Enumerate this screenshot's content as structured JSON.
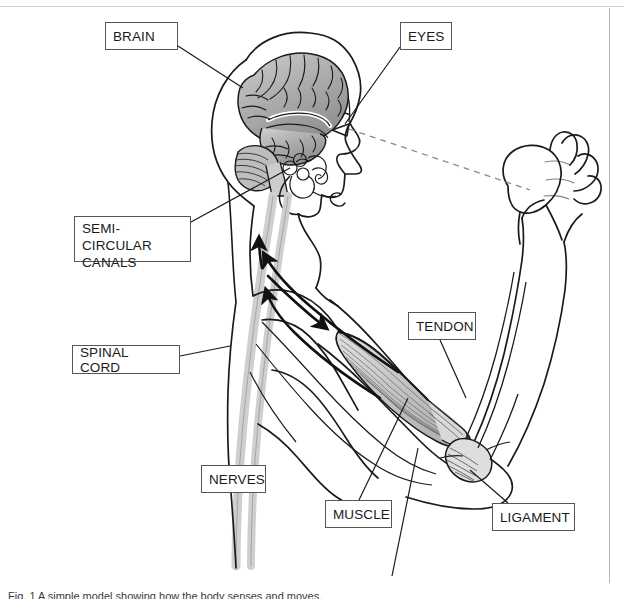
{
  "figure": {
    "background_color": "#ffffff",
    "line_color": "#1a1a1a",
    "brain_fill": "#a8a8a8",
    "nerve_fill": "#d6d6d6",
    "muscle_fill": "#c9c9c9",
    "caption": "Fig. 1  A simple model showing how the body senses and moves."
  },
  "labels": [
    {
      "id": "brain",
      "text": "BRAIN",
      "x": 105,
      "y": 22,
      "w": 73,
      "h": 28,
      "lines": 1
    },
    {
      "id": "eyes",
      "text": "EYES",
      "x": 400,
      "y": 22,
      "w": 52,
      "h": 28,
      "lines": 1
    },
    {
      "id": "semi-circular-canals",
      "text": "SEMI-CIRCULAR\nCANALS",
      "x": 74,
      "y": 216,
      "w": 117,
      "h": 46,
      "lines": 2
    },
    {
      "id": "spinal-cord",
      "text": "SPINAL CORD",
      "x": 72,
      "y": 345,
      "w": 108,
      "h": 29,
      "lines": 1
    },
    {
      "id": "nerves",
      "text": "NERVES",
      "x": 201,
      "y": 465,
      "w": 65,
      "h": 28,
      "lines": 1
    },
    {
      "id": "tendon",
      "text": "TENDON",
      "x": 408,
      "y": 312,
      "w": 68,
      "h": 28,
      "lines": 1
    },
    {
      "id": "muscle",
      "text": "MUSCLE",
      "x": 325,
      "y": 500,
      "w": 67,
      "h": 28,
      "lines": 1
    },
    {
      "id": "ligament",
      "text": "LIGAMENT",
      "x": 492,
      "y": 503,
      "w": 83,
      "h": 28,
      "lines": 1
    }
  ],
  "leader_lines": [
    {
      "id": "brain",
      "from": [
        178,
        46
      ],
      "to": [
        243,
        88
      ]
    },
    {
      "id": "eyes",
      "from": [
        400,
        47
      ],
      "to": [
        345,
        122
      ]
    },
    {
      "id": "semi-circular-canals",
      "from": [
        191,
        222
      ],
      "to": [
        287,
        170
      ]
    },
    {
      "id": "spinal-cord",
      "from": [
        180,
        356
      ],
      "to": [
        228,
        348
      ]
    },
    {
      "id": "tendon",
      "from": [
        440,
        340
      ],
      "to": [
        464,
        393
      ]
    },
    {
      "id": "muscle",
      "from": [
        359,
        500
      ],
      "to": [
        409,
        398
      ]
    },
    {
      "id": "ligament",
      "from": [
        505,
        503
      ],
      "to": [
        464,
        468
      ]
    }
  ],
  "annotations": {
    "sight_line": "dashed line from eye to raised fist",
    "signal_arrows": "arrows along the nerve path from arm to spinal cord and brain"
  }
}
